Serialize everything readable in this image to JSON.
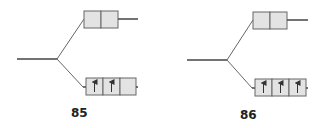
{
  "diagrams": [
    {
      "label": "85",
      "upper_level": {
        "orbitals": 2,
        "electrons": [
          0,
          0
        ]
      },
      "lower_level": {
        "orbitals": 3,
        "electrons": [
          1,
          1,
          0
        ]
      }
    },
    {
      "label": "86",
      "upper_level": {
        "orbitals": 2,
        "electrons": [
          0,
          0
        ]
      },
      "lower_level": {
        "orbitals": 3,
        "electrons": [
          1,
          1,
          1
        ]
      }
    }
  ],
  "colors": {
    "line": "#555555",
    "box_fill": "#e3e3e3",
    "box_stroke": "#666666",
    "arrow": "#333333"
  }
}
